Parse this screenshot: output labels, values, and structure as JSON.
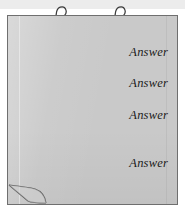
{
  "document": {
    "kind": "flipchart-sheet",
    "background_color": "#ffffff",
    "header_band_color": "#ececec"
  },
  "sheet": {
    "fill_color": "#c9c9c9",
    "border_color": "#6f6f6f"
  },
  "hooks": [
    {
      "name": "hook-left",
      "label": ""
    },
    {
      "name": "hook-right",
      "label": ""
    }
  ],
  "answers": [
    {
      "label": "Answer"
    },
    {
      "label": "Answer"
    },
    {
      "label": "Answer"
    },
    {
      "label": "Answer"
    }
  ],
  "corner": {
    "name": "page-curl",
    "label": ""
  }
}
